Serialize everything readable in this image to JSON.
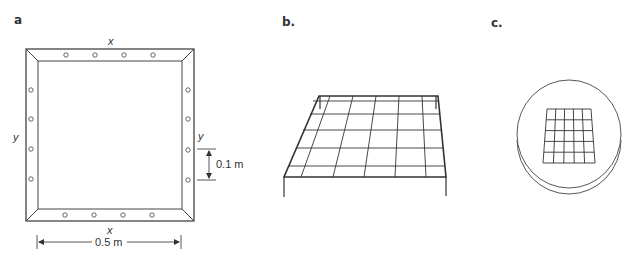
{
  "panels": {
    "a": {
      "label": "a",
      "top_axis": "x",
      "bottom_axis": "x",
      "left_axis": "y",
      "right_axis": "y",
      "spacing_dimension": "0.1 m",
      "width_dimension": "0.5 m",
      "holes_per_side": 4
    },
    "b": {
      "label": "b.",
      "grid_cells": "6 x 5"
    },
    "c": {
      "label": "c.",
      "grid_cells": "5 x 5"
    }
  },
  "colors": {
    "line": "#444444",
    "background": "#ffffff"
  }
}
